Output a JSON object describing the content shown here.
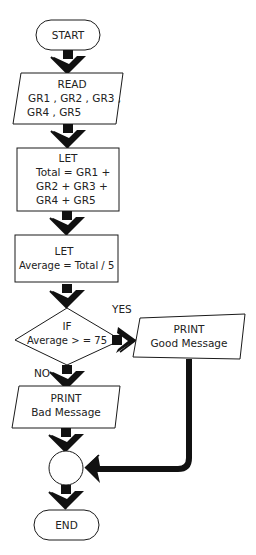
{
  "flowchart": {
    "start": {
      "label": "START"
    },
    "read": {
      "line1": "READ",
      "line2": "GR1 , GR2 , GR3 ,",
      "line3": "GR4 , GR5"
    },
    "let_total": {
      "line1": "LET",
      "line2": "Total = GR1 +",
      "line3": "GR2 + GR3 +",
      "line4": "GR4 + GR5"
    },
    "let_average": {
      "line1": "LET",
      "line2": "Average =  Total / 5"
    },
    "decision": {
      "line1": "IF",
      "line2": "Average > = 75",
      "yes_label": "YES",
      "no_label": "NO"
    },
    "print_good": {
      "line1": "PRINT",
      "line2": "Good Message"
    },
    "print_bad": {
      "line1": "PRINT",
      "line2": "Bad Message"
    },
    "end": {
      "label": "END"
    }
  },
  "colors": {
    "stroke": "#1a1a1a",
    "fill": "#ffffff",
    "arrow": "#111111"
  }
}
